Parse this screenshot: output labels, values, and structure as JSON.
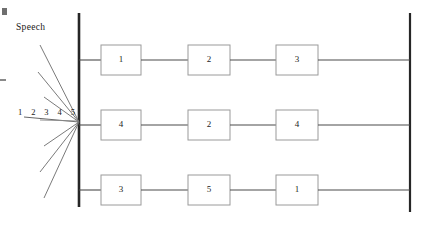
{
  "figure": {
    "type": "process-flow-diagram",
    "background": "#ffffff",
    "width": 422,
    "height": 225,
    "labels": {
      "speech": "Speech",
      "input_numbers": "1 2 3 4 5"
    },
    "colors": {
      "bar": "#262626",
      "box_border": "#9a9a9a",
      "connector": "#4a4a4a",
      "fan_line": "#6b6b6b",
      "text": "#1d1d1d",
      "artifact": "#7a7a7a"
    },
    "bars": [
      {
        "name": "left-bar",
        "x": 79,
        "y1": 13,
        "y2": 207,
        "width": 2.6
      },
      {
        "name": "right-bar",
        "x": 410,
        "y1": 13,
        "y2": 212,
        "width": 2.2
      }
    ],
    "rows": [
      {
        "name": "row-top",
        "y": 60,
        "boxes": [
          {
            "label": "1",
            "x": 101,
            "y": 45,
            "w": 40,
            "h": 30
          },
          {
            "label": "2",
            "x": 188,
            "y": 45,
            "w": 42,
            "h": 30
          },
          {
            "label": "3",
            "x": 276,
            "y": 45,
            "w": 42,
            "h": 30
          }
        ]
      },
      {
        "name": "row-middle",
        "y": 125,
        "boxes": [
          {
            "label": "4",
            "x": 101,
            "y": 110,
            "w": 40,
            "h": 30
          },
          {
            "label": "2",
            "x": 188,
            "y": 110,
            "w": 42,
            "h": 30
          },
          {
            "label": "4",
            "x": 276,
            "y": 110,
            "w": 42,
            "h": 30
          }
        ]
      },
      {
        "name": "row-bottom",
        "y": 190,
        "boxes": [
          {
            "label": "3",
            "x": 101,
            "y": 175,
            "w": 40,
            "h": 30
          },
          {
            "label": "5",
            "x": 188,
            "y": 175,
            "w": 42,
            "h": 30
          },
          {
            "label": "1",
            "x": 276,
            "y": 175,
            "w": 42,
            "h": 30
          }
        ]
      }
    ],
    "fan": {
      "origin_x": 79,
      "origin_y": 122,
      "rays": [
        {
          "x": 40,
          "y": 45
        },
        {
          "x": 38,
          "y": 72
        },
        {
          "x": 44,
          "y": 97
        },
        {
          "x": 24,
          "y": 117
        },
        {
          "x": 44,
          "y": 146
        },
        {
          "x": 40,
          "y": 172
        },
        {
          "x": 44,
          "y": 198
        }
      ]
    },
    "artifacts": [
      {
        "name": "corner-square-mark",
        "x": 2,
        "y": 8,
        "w": 5,
        "h": 7
      },
      {
        "name": "edge-dash-mark",
        "x": 0,
        "y": 79,
        "w": 6,
        "h": 2
      }
    ]
  }
}
